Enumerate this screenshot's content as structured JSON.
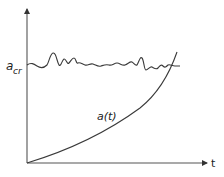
{
  "diagram": {
    "type": "function-plot",
    "axes": {
      "x_label": "t",
      "y_label": "",
      "origin": [
        27,
        163
      ]
    },
    "curves": [
      {
        "name": "critical-threshold",
        "label": "a",
        "label_subscript": "cr",
        "style": "wavy-noisy",
        "description": "Fluctuating horizontal threshold level"
      },
      {
        "name": "growth-curve",
        "label": "a(t)",
        "style": "exponential",
        "description": "Monotonically increasing curve crossing the threshold"
      }
    ],
    "colors": {
      "line": "#3a3a3a",
      "background": "#ffffff"
    }
  }
}
